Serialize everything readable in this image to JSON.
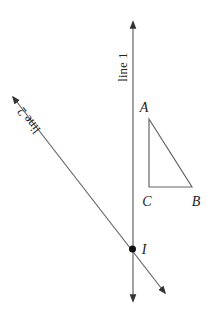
{
  "diagram": {
    "lines": [
      {
        "name": "line 1",
        "label": "line 1",
        "from": [
          133,
          20
        ],
        "to": [
          133,
          303
        ],
        "arrows": "both"
      },
      {
        "name": "line 2",
        "label": "line 2",
        "from": [
          12,
          96
        ],
        "to": [
          166,
          294
        ],
        "arrows": "both"
      }
    ],
    "triangle": {
      "vertices": {
        "A": [
          149,
          119
        ],
        "B": [
          192,
          187
        ],
        "C": [
          149,
          187
        ]
      },
      "labels": {
        "A": "A",
        "B": "B",
        "C": "C"
      }
    },
    "intersection": {
      "label": "I",
      "point": [
        132,
        249
      ]
    },
    "colors": {
      "stroke": "#666666",
      "text": "#222222",
      "point": "#111111"
    }
  }
}
